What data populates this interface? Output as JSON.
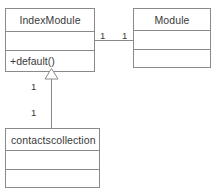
{
  "diagram": {
    "type": "uml-class-diagram",
    "canvas": {
      "width": 217,
      "height": 192,
      "background": "#ffffff"
    },
    "stroke_color": "#8a8a8a",
    "text_color": "#3a3a3a",
    "classes": [
      {
        "id": "indexmodule",
        "name": "IndexModule",
        "name_align": "center",
        "attributes": [],
        "operations": [
          "+default()"
        ]
      },
      {
        "id": "module",
        "name": "Module",
        "name_align": "center",
        "attributes": [],
        "operations": []
      },
      {
        "id": "contactscollection",
        "name": "contactscollection",
        "name_align": "left",
        "attributes": [],
        "operations": []
      }
    ],
    "relationships": [
      {
        "id": "assoc-indexmodule-module",
        "kind": "association",
        "source": "IndexModule",
        "target": "Module",
        "source_multiplicity": "1",
        "target_multiplicity": "1"
      },
      {
        "id": "gen-contactscollection-indexmodule",
        "kind": "generalization",
        "source": "contactscollection",
        "target": "IndexModule",
        "source_multiplicity": "1",
        "target_multiplicity": "1",
        "arrowhead": "hollow-triangle"
      }
    ]
  }
}
